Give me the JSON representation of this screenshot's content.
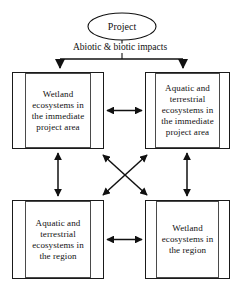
{
  "diagram": {
    "title": "Project",
    "impacts_label": "Abiotic & biotic impacts",
    "source_node": {
      "id": "project",
      "shape": "ellipse",
      "label": "Project"
    },
    "nodes": [
      {
        "id": "wetland-immediate",
        "position": "top-left",
        "label": "Wetland ecosystems in the immediate project area"
      },
      {
        "id": "aquatic-terrestrial-immediate",
        "position": "top-right",
        "label": "Aquatic and terrestrial ecosystems in the immediate project area"
      },
      {
        "id": "aquatic-terrestrial-region",
        "position": "bottom-left",
        "label": "Aquatic and terrestrial ecosystems in the region"
      },
      {
        "id": "wetland-region",
        "position": "bottom-right",
        "label": "Wetland ecosystems in the region"
      }
    ],
    "connectors": [
      {
        "id": "project-to-top-left",
        "from": "project",
        "to": "wetland-immediate",
        "style": "single-arrow"
      },
      {
        "id": "project-to-top-right",
        "from": "project",
        "to": "aquatic-terrestrial-immediate",
        "style": "single-arrow"
      },
      {
        "id": "top-horizontal",
        "from": "wetland-immediate",
        "to": "aquatic-terrestrial-immediate",
        "style": "double-arrow"
      },
      {
        "id": "bottom-horizontal",
        "from": "aquatic-terrestrial-region",
        "to": "wetland-region",
        "style": "double-arrow"
      },
      {
        "id": "left-vertical",
        "from": "wetland-immediate",
        "to": "aquatic-terrestrial-region",
        "style": "double-arrow"
      },
      {
        "id": "right-vertical",
        "from": "aquatic-terrestrial-immediate",
        "to": "wetland-region",
        "style": "double-arrow"
      },
      {
        "id": "diagonal-tl-br",
        "from": "wetland-immediate",
        "to": "wetland-region",
        "style": "double-arrow"
      },
      {
        "id": "diagonal-tr-bl",
        "from": "aquatic-terrestrial-immediate",
        "to": "aquatic-terrestrial-region",
        "style": "double-arrow"
      }
    ],
    "colors": {
      "stroke": "#1a1a1a",
      "inner_stroke": "#4a4a4a",
      "text": "#111111",
      "background": "#ffffff"
    }
  }
}
